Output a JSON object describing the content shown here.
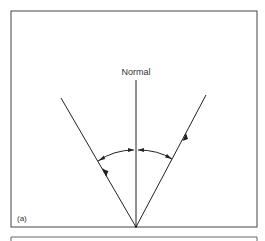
{
  "figure": {
    "normal_label": "Normal",
    "panel_label": "(a)",
    "line_color": "#222222",
    "frame_color": "#444444"
  },
  "geometry": {
    "frame": {
      "x": 11,
      "y": 11,
      "w": 246,
      "h": 216
    },
    "second_frame_top": 237,
    "reflection_point": {
      "x": 136,
      "y": 227
    },
    "normal_top": {
      "x": 136,
      "y": 80
    },
    "incident_start": {
      "x": 61,
      "y": 98
    },
    "reflected_end": {
      "x": 206,
      "y": 95
    }
  }
}
